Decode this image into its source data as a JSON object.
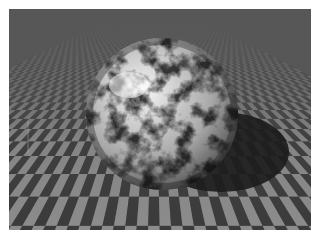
{
  "scene": {
    "description": "Ray-traced marble-textured sphere resting on an infinite checkerboard floor with a cast shadow",
    "colors": {
      "background": "#ffffff",
      "checker_light": "#8c8c8c",
      "checker_dark": "#3b3b3b",
      "horizon_blend": "#575757",
      "sphere_highlight": "#f2f2f2",
      "sphere_base": "#bdbdbd",
      "marble_veins": "#2e2e2e",
      "shadow": "#1c1c1c"
    },
    "sphere": {
      "cx": 153,
      "cy": 105,
      "r": 76
    },
    "shadow": {
      "cx": 210,
      "cy": 143,
      "rx": 70,
      "ry": 40
    }
  }
}
